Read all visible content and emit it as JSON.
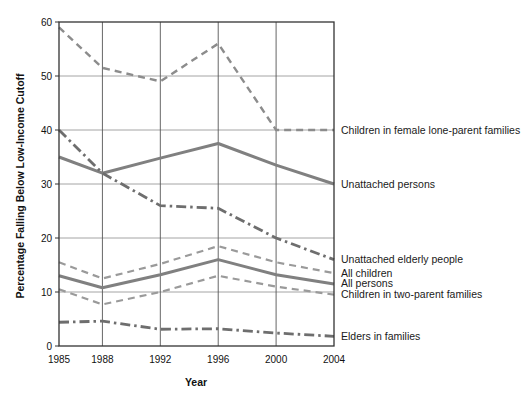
{
  "chart_data": {
    "type": "line",
    "title": "",
    "xlabel": "Year",
    "ylabel": "Percentage Falling Below Low-Income Cutoff",
    "x": [
      1985,
      1988,
      1992,
      1996,
      2000,
      2004
    ],
    "xtick_labels": [
      "1985",
      "1988",
      "1992",
      "1996",
      "2000",
      "2004"
    ],
    "ytick_labels": [
      "0",
      "10",
      "20",
      "30",
      "40",
      "50",
      "60"
    ],
    "yticks": [
      0,
      10,
      20,
      30,
      40,
      50,
      60
    ],
    "ylim": [
      0,
      60
    ],
    "xlim": [
      1985,
      2004
    ],
    "grid": "horizontal-and-vertical",
    "legend_position": "right-inline-labels",
    "series": [
      {
        "name": "Children in female lone-parent families",
        "style": "dashed",
        "color": "#8c8c8c",
        "width": 2.4,
        "values": [
          59,
          51.5,
          49,
          56,
          40,
          40
        ]
      },
      {
        "name": "Unattached persons",
        "style": "solid",
        "color": "#808080",
        "width": 3,
        "values": [
          35,
          32,
          34.8,
          37.5,
          33.5,
          30
        ]
      },
      {
        "name": "Unattached elderly people",
        "style": "dash-dot",
        "color": "#6e6e6e",
        "width": 2.8,
        "values": [
          40,
          32,
          26,
          25.5,
          20,
          16
        ]
      },
      {
        "name": "All children",
        "style": "dashed",
        "color": "#9a9a9a",
        "width": 2.2,
        "values": [
          15.5,
          12.5,
          15.2,
          18.5,
          15.5,
          13.5
        ]
      },
      {
        "name": "All persons",
        "style": "solid",
        "color": "#808080",
        "width": 3,
        "values": [
          13,
          10.8,
          13.2,
          16,
          13.2,
          11.5
        ]
      },
      {
        "name": "Children in two-parent families",
        "style": "dashed",
        "color": "#9a9a9a",
        "width": 2.2,
        "values": [
          10.5,
          7.7,
          10,
          13,
          11,
          9.5
        ]
      },
      {
        "name": "Elders in families",
        "style": "dash-dot",
        "color": "#6e6e6e",
        "width": 2.8,
        "values": [
          4.4,
          4.6,
          3.1,
          3.2,
          2.4,
          1.8
        ]
      }
    ]
  },
  "legend_labels": [
    "Children in female lone-parent families",
    "Unattached persons",
    "Unattached elderly people",
    "All children",
    "All persons",
    "Children in two-parent families",
    "Elders in families"
  ]
}
